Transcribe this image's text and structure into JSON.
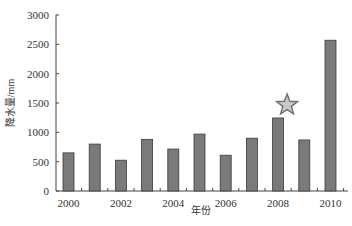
{
  "chart_data": {
    "type": "bar",
    "title": "",
    "xlabel": "年份",
    "ylabel": "降水量/mm",
    "categories": [
      "2000",
      "2001",
      "2002",
      "2003",
      "2004",
      "2005",
      "2006",
      "2007",
      "2008",
      "2009",
      "2010"
    ],
    "x_tick_labels": [
      "2000",
      "2002",
      "2004",
      "2006",
      "2008",
      "2010"
    ],
    "values": [
      650,
      800,
      525,
      880,
      715,
      970,
      610,
      900,
      1245,
      870,
      2570
    ],
    "ylim": [
      0,
      3000
    ],
    "y_ticks": [
      0,
      500,
      1000,
      1500,
      2000,
      2500,
      3000
    ],
    "grid": false,
    "legend": null,
    "annotations": [
      {
        "type": "star-marker",
        "category": "2008",
        "description": "star above 2008 bar"
      }
    ],
    "colors": {
      "bar_fill": "#7a7a7a",
      "bar_stroke": "#3a3a3a",
      "star_fill": "#c8c8c8",
      "star_stroke": "#707070",
      "axis": "#444444"
    }
  }
}
